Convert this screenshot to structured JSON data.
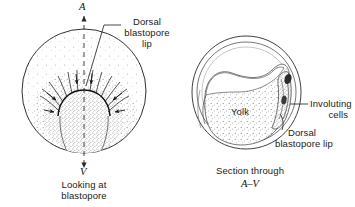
{
  "figure": {
    "background_color": "#ffffff",
    "ink_color": "#1a1a1a",
    "stipple_color": "#9a9a9a"
  },
  "left_panel": {
    "name": "surface view of blastopore",
    "pole_marker_top": "A",
    "pole_marker_bottom": "V",
    "callout_label": "Dorsal\nblastopore\nlip",
    "callout_label_lines": [
      "Dorsal",
      "blastopore",
      "lip"
    ],
    "caption_lines": [
      "Looking at",
      "blastopore"
    ],
    "caption": "Looking at blastopore"
  },
  "right_panel": {
    "name": "sagittal section of gastrula",
    "yolk_label": "Yolk",
    "involuting_label_lines": [
      "Involuting",
      "cells"
    ],
    "involuting_label": "Involuting cells",
    "dorsal_lip_label_lines": [
      "Dorsal",
      "blastopore lip"
    ],
    "dorsal_lip_label": "Dorsal blastopore lip",
    "caption_line1": "Section through",
    "caption_line2": "A–V",
    "caption": "Section through A–V"
  }
}
